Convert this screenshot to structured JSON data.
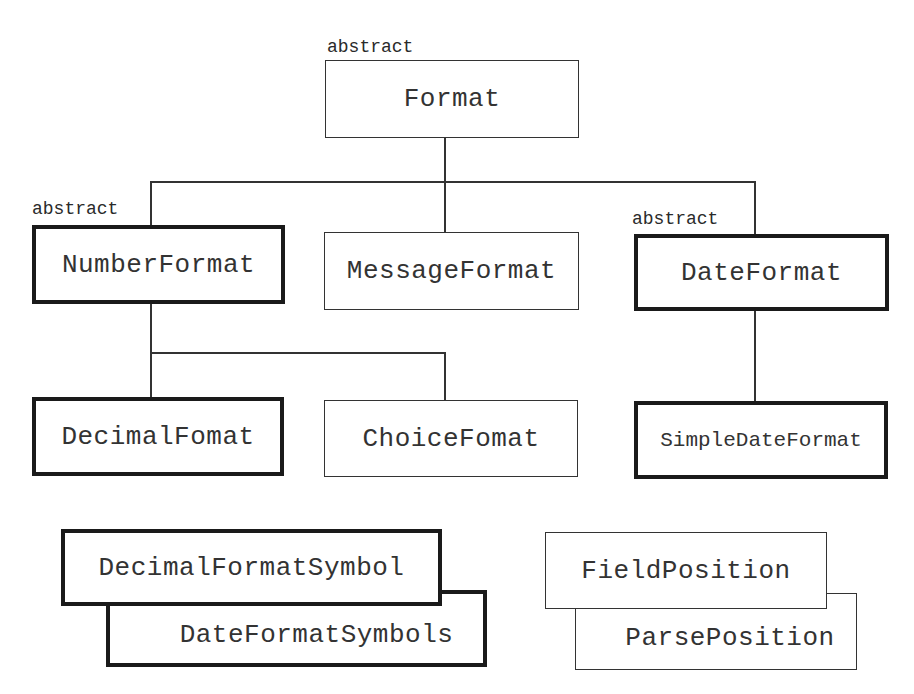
{
  "diagram": {
    "title": "",
    "abstract_label": "abstract",
    "classes": {
      "format": {
        "name": "Format",
        "abstract": true,
        "border": "thin"
      },
      "number_format": {
        "name": "NumberFormat",
        "abstract": true,
        "border": "thick"
      },
      "message_format": {
        "name": "MessageFormat",
        "abstract": false,
        "border": "thin"
      },
      "date_format": {
        "name": "DateFormat",
        "abstract": true,
        "border": "thick"
      },
      "decimal_format": {
        "name": "DecimalFomat",
        "abstract": false,
        "border": "thick"
      },
      "choice_format": {
        "name": "ChoiceFomat",
        "abstract": false,
        "border": "thin"
      },
      "simple_date_format": {
        "name": "SimpleDateFormat",
        "abstract": false,
        "border": "thick"
      },
      "decimal_format_symbol": {
        "name": "DecimalFormatSymbol",
        "abstract": false,
        "border": "thick"
      },
      "date_format_symbols": {
        "name": "DateFormatSymbols",
        "abstract": false,
        "border": "thick"
      },
      "field_position": {
        "name": "FieldPosition",
        "abstract": false,
        "border": "thin"
      },
      "parse_position": {
        "name": "ParsePosition",
        "abstract": false,
        "border": "thin"
      }
    },
    "edges": [
      {
        "from": "Format",
        "to": "NumberFormat"
      },
      {
        "from": "Format",
        "to": "MessageFormat"
      },
      {
        "from": "Format",
        "to": "DateFormat"
      },
      {
        "from": "NumberFormat",
        "to": "DecimalFomat"
      },
      {
        "from": "NumberFormat",
        "to": "ChoiceFomat"
      },
      {
        "from": "DateFormat",
        "to": "SimpleDateFormat"
      }
    ]
  }
}
